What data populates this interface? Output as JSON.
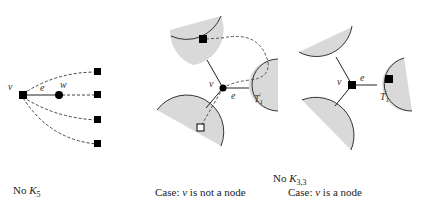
{
  "figure": {
    "panel_k5": {
      "caption_prefix": "No",
      "caption_math": "K",
      "caption_sub": "5",
      "labels": {
        "v": "v",
        "e": "e",
        "w": "w"
      }
    },
    "k33_header": {
      "prefix": "No",
      "math": "K",
      "sub": "3,3"
    },
    "panel_not_node": {
      "caption_text_before": "Case:",
      "caption_var": "v",
      "caption_text_after": "is not a node",
      "labels": {
        "v": "v",
        "e": "e",
        "t": "T",
        "t_sub": "1",
        "t_prime": "′"
      }
    },
    "panel_node": {
      "caption_text_before": "Case:",
      "caption_var": "v",
      "caption_text_after": "is a node",
      "labels": {
        "v": "v",
        "e": "e",
        "t": "T",
        "t_sub": "1",
        "t_prime": "′"
      }
    },
    "colors": {
      "fill_region": "#d9d9d9",
      "stroke": "#333333",
      "node": "#000000"
    }
  }
}
